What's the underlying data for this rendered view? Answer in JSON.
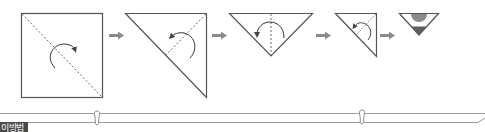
{
  "diagram": {
    "steps": [
      {
        "shape": "square",
        "fold_line": "diagonal",
        "arrow": "fold-over"
      },
      {
        "shape": "right-triangle",
        "fold_line": "diagonal",
        "arrow": "fold-over"
      },
      {
        "shape": "inverted-triangle",
        "fold_line": "vertical-center",
        "arrow": "fold-over"
      },
      {
        "shape": "small-right-triangle",
        "fold_line": "diagonal",
        "arrow": "fold-over"
      },
      {
        "shape": "finished-triangle",
        "fold_line": "none",
        "arrow": "none"
      }
    ],
    "step_arrows": 4
  },
  "footer": {
    "label": "이방법"
  },
  "colors": {
    "line": "#555555",
    "arrow": "#8a8a8a",
    "rail": "#9a9a9a",
    "semicircle": "#8c8c8c",
    "fill_triangle": "#5e5e5e",
    "tab_bg": "#4a4a4a"
  }
}
